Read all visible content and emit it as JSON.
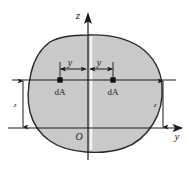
{
  "figure": {
    "type": "engineering-diagram",
    "canvas": {
      "width": 189,
      "height": 176
    },
    "colors": {
      "shape_fill": "#c9c9c9",
      "shape_stroke": "#2b2b2b",
      "axis": "#1a1a1a",
      "background": "#ffffff",
      "symmetry_strip": "#f2f2f2"
    },
    "axes": {
      "vertical": {
        "label": "z",
        "x": 88,
        "y_top": 14,
        "y_bottom": 160,
        "arrow": "up"
      },
      "horizontal": {
        "label": "y",
        "y": 128,
        "x_left": 8,
        "x_right": 182,
        "arrow": "right"
      },
      "origin": {
        "label": "O",
        "x": 79,
        "y": 140
      }
    },
    "elements": {
      "left_area_element": {
        "label": "dA",
        "marker_x": 60,
        "marker_y": 80,
        "label_x": 54,
        "label_y": 93
      },
      "right_area_element": {
        "label": "dA",
        "marker_x": 113,
        "marker_y": 80,
        "label_x": 107,
        "label_y": 93
      },
      "left_horizontal_dimension": {
        "label": "y",
        "from_x": 60,
        "to_x": 86,
        "y": 69,
        "label_x": 70,
        "label_y": 66
      },
      "right_horizontal_dimension": {
        "label": "y",
        "from_x": 90,
        "to_x": 113,
        "y": 69,
        "label_x": 99,
        "label_y": 66
      },
      "left_vertical_dimension": {
        "label": "z",
        "x": 23,
        "from_y": 80,
        "to_y": 128,
        "label_x": 20,
        "label_y": 107
      },
      "right_vertical_dimension": {
        "label": "z",
        "x": 163,
        "from_y": 80,
        "to_y": 128,
        "label_x": 160,
        "label_y": 107
      },
      "element_level_line": {
        "y": 80,
        "x_left": 12,
        "x_right": 176
      }
    },
    "shape_outline_path": "M 88 35 C 108 34 126 38 140 47 C 154 57 161 71 162 86 C 163 100 160 113 153 124 C 146 135 136 144 124 148 C 112 152 98 153 86 152 C 73 151 60 148 50 141 C 40 134 33 124 30 112 C 27 100 28 86 31 73 C 34 60 40 49 50 42 C 60 36 73 35 88 35 Z"
  }
}
